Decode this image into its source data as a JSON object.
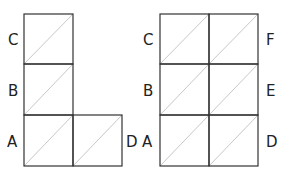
{
  "figures": [
    {
      "name": "l-shape-grid",
      "cells": [
        {
          "col": 0,
          "row": 0
        },
        {
          "col": 0,
          "row": 1
        },
        {
          "col": 0,
          "row": 2
        },
        {
          "col": 1,
          "row": 2
        }
      ],
      "labels": {
        "C": "C",
        "B": "B",
        "A": "A",
        "D": "D"
      }
    },
    {
      "name": "rectangle-grid",
      "cols": 2,
      "rows": 3,
      "labels": {
        "C": "C",
        "B": "B",
        "A": "A",
        "F": "F",
        "E": "E",
        "D": "D"
      }
    }
  ],
  "colors": {
    "line": "#333333",
    "diagonal": "#c8c8c8",
    "text": "#222222"
  }
}
